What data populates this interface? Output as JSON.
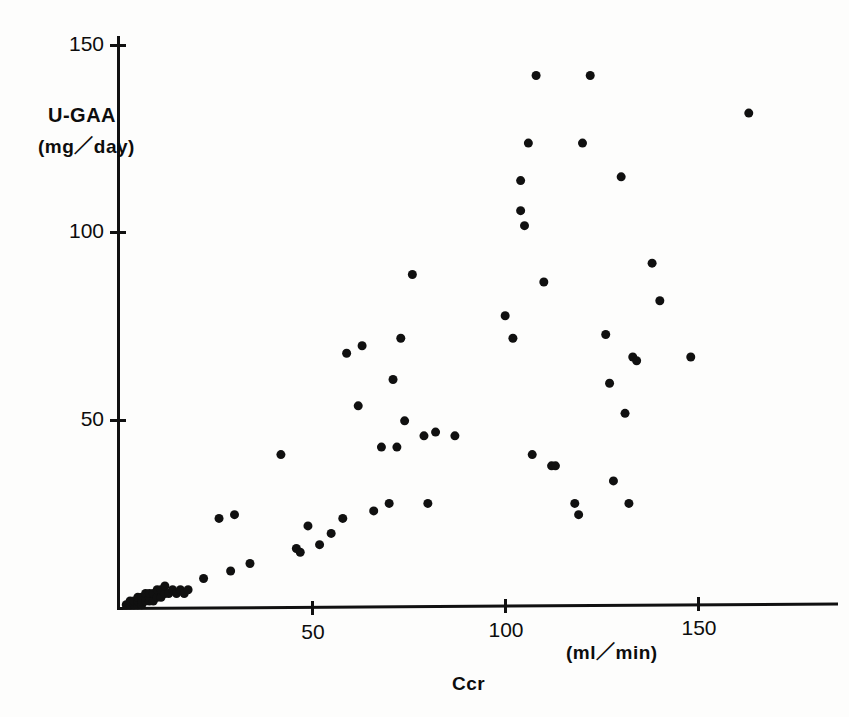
{
  "figure": {
    "background_color": "#fdfdfc",
    "ink_color": "#101010"
  },
  "axes": {
    "y": {
      "label": "U-GAA",
      "units": "(mg／day)",
      "ticks": [
        {
          "value": 50,
          "text": "50"
        },
        {
          "value": 100,
          "text": "100"
        },
        {
          "value": 150,
          "text": "150"
        }
      ]
    },
    "x": {
      "label": "Ccr",
      "units": "(ml／min)",
      "ticks": [
        {
          "value": 50,
          "text": "50"
        },
        {
          "value": 100,
          "text": "100"
        },
        {
          "value": 150,
          "text": "150"
        }
      ]
    }
  },
  "chart_data": {
    "type": "scatter",
    "title": "",
    "xlabel": "Ccr",
    "xunits": "(ml/min)",
    "ylabel": "U-GAA",
    "yunits": "(mg/day)",
    "xlim": [
      0,
      170
    ],
    "ylim": [
      0,
      152
    ],
    "xticks": [
      50,
      100,
      150
    ],
    "yticks": [
      50,
      100,
      150
    ],
    "grid": false,
    "legend": null,
    "marker": "filled-circle",
    "marker_color": "#101010",
    "marker_size_px": 9,
    "n_points": 80,
    "points": [
      [
        2,
        1
      ],
      [
        3,
        1
      ],
      [
        3,
        2
      ],
      [
        4,
        1
      ],
      [
        4,
        2
      ],
      [
        5,
        1
      ],
      [
        5,
        2
      ],
      [
        5,
        3
      ],
      [
        6,
        1
      ],
      [
        6,
        2
      ],
      [
        6,
        3
      ],
      [
        7,
        2
      ],
      [
        7,
        3
      ],
      [
        7,
        4
      ],
      [
        8,
        2
      ],
      [
        8,
        3
      ],
      [
        8,
        4
      ],
      [
        9,
        2
      ],
      [
        9,
        4
      ],
      [
        10,
        3
      ],
      [
        10,
        5
      ],
      [
        11,
        3
      ],
      [
        11,
        5
      ],
      [
        12,
        4
      ],
      [
        12,
        6
      ],
      [
        13,
        4
      ],
      [
        14,
        5
      ],
      [
        15,
        4
      ],
      [
        16,
        5
      ],
      [
        17,
        4
      ],
      [
        18,
        5
      ],
      [
        22,
        8
      ],
      [
        26,
        24
      ],
      [
        30,
        25
      ],
      [
        29,
        10
      ],
      [
        34,
        12
      ],
      [
        42,
        41
      ],
      [
        46,
        16
      ],
      [
        47,
        15
      ],
      [
        49,
        22
      ],
      [
        52,
        17
      ],
      [
        55,
        20
      ],
      [
        58,
        24
      ],
      [
        59,
        68
      ],
      [
        62,
        54
      ],
      [
        63,
        70
      ],
      [
        66,
        26
      ],
      [
        68,
        43
      ],
      [
        70,
        28
      ],
      [
        71,
        61
      ],
      [
        72,
        43
      ],
      [
        73,
        72
      ],
      [
        74,
        50
      ],
      [
        76,
        89
      ],
      [
        79,
        46
      ],
      [
        80,
        28
      ],
      [
        82,
        47
      ],
      [
        87,
        46
      ],
      [
        100,
        78
      ],
      [
        102,
        72
      ],
      [
        104,
        106
      ],
      [
        104,
        114
      ],
      [
        105,
        102
      ],
      [
        106,
        124
      ],
      [
        107,
        41
      ],
      [
        108,
        142
      ],
      [
        110,
        87
      ],
      [
        112,
        38
      ],
      [
        113,
        38
      ],
      [
        118,
        28
      ],
      [
        119,
        25
      ],
      [
        120,
        124
      ],
      [
        122,
        142
      ],
      [
        126,
        73
      ],
      [
        127,
        60
      ],
      [
        128,
        34
      ],
      [
        130,
        115
      ],
      [
        131,
        52
      ],
      [
        132,
        28
      ],
      [
        133,
        67
      ],
      [
        134,
        66
      ],
      [
        138,
        92
      ],
      [
        140,
        82
      ],
      [
        148,
        67
      ],
      [
        163,
        132
      ]
    ]
  }
}
